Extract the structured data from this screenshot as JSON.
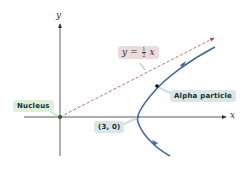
{
  "diagram": {
    "type": "hyperbolic trajectory",
    "axes": {
      "x_label": "x",
      "y_label": "y"
    },
    "asymptote": {
      "equation_lhs": "y =",
      "fraction_numerator": "1",
      "fraction_denominator": "2",
      "equation_var": "x",
      "style": "dashed",
      "color": "#b5484e"
    },
    "labels": {
      "nucleus": "Nucleus",
      "alpha_particle": "Alpha particle",
      "vertex": "(3, 0)"
    },
    "colors": {
      "curve": "#4a6a9a",
      "axis": "#333333",
      "asymptote": "#b5484e",
      "nucleus_label_bg": "#dcefd9",
      "blue_label_bg": "#d8e6ea",
      "equation_label_bg": "#ecdadc"
    }
  }
}
